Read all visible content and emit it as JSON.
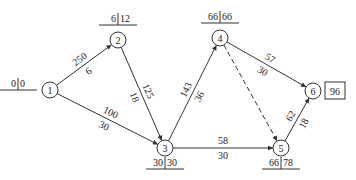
{
  "nodes": [
    {
      "id": "1",
      "x": 50,
      "y": 90,
      "label": "1",
      "early": "0",
      "late": "0",
      "tl": {
        "x": 14,
        "y": 90,
        "side": "left"
      }
    },
    {
      "id": "2",
      "x": 118,
      "y": 40,
      "label": "2",
      "early": "6",
      "late": "12",
      "tl": {
        "x": 118,
        "y": 22,
        "side": "top"
      }
    },
    {
      "id": "3",
      "x": 165,
      "y": 148,
      "label": "3",
      "early": "30",
      "late": "30",
      "tl": {
        "x": 165,
        "y": 166,
        "side": "bottom"
      }
    },
    {
      "id": "4",
      "x": 220,
      "y": 38,
      "label": "4",
      "early": "66",
      "late": "66",
      "tl": {
        "x": 220,
        "y": 20,
        "side": "top"
      }
    },
    {
      "id": "5",
      "x": 281,
      "y": 148,
      "label": "5",
      "early": "66",
      "late": "78",
      "tl": {
        "x": 281,
        "y": 166,
        "side": "bottom"
      }
    },
    {
      "id": "6",
      "x": 313,
      "y": 91,
      "label": "6",
      "final_time": "96"
    }
  ],
  "edges": [
    {
      "from": "1",
      "to": "2",
      "top": "250",
      "bottom": "6",
      "dashed": false
    },
    {
      "from": "1",
      "to": "3",
      "top": "100",
      "bottom": "30",
      "dashed": false
    },
    {
      "from": "2",
      "to": "3",
      "top": "125",
      "bottom": "18",
      "dashed": false
    },
    {
      "from": "3",
      "to": "4",
      "top": "143",
      "bottom": "36",
      "dashed": false
    },
    {
      "from": "3",
      "to": "5",
      "top": "58",
      "bottom": "30",
      "dashed": false
    },
    {
      "from": "4",
      "to": "6",
      "top": "57",
      "bottom": "30",
      "dashed": false
    },
    {
      "from": "4",
      "to": "5",
      "top": "",
      "bottom": "",
      "dashed": true
    },
    {
      "from": "5",
      "to": "6",
      "top": "62",
      "bottom": "18",
      "dashed": false
    }
  ],
  "final_box": {
    "value": "96"
  },
  "colors": {
    "stroke": "#333333",
    "text": "#222222",
    "background": "#ffffff"
  }
}
